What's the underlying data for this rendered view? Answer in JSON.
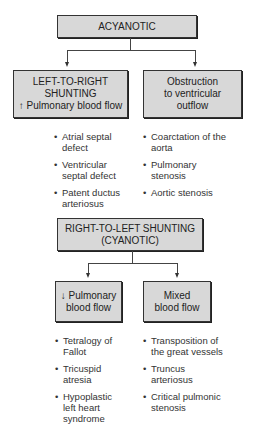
{
  "acyanotic": {
    "title": "ACYANOTIC",
    "left": {
      "line1": "LEFT-TO-RIGHT",
      "line2": "SHUNTING",
      "line3": "↑ Pulmonary blood flow",
      "items": [
        "Atrial septal defect",
        "Ventricular septal defect",
        "Patent ductus arteriosus"
      ]
    },
    "right": {
      "line1": "Obstruction",
      "line2": "to ventricular",
      "line3": "outflow",
      "items": [
        "Coarctation of the aorta",
        "Pulmonary stenosis",
        "Aortic stenosis"
      ]
    }
  },
  "cyanotic": {
    "title_line1": "RIGHT-TO-LEFT SHUNTING",
    "title_line2": "(CYANOTIC)",
    "left": {
      "line1": "↓ Pulmonary",
      "line2": "blood flow",
      "items": [
        "Tetralogy of Fallot",
        "Tricuspid atresia",
        "Hypoplastic left heart syndrome"
      ]
    },
    "right": {
      "line1": "Mixed",
      "line2": "blood flow",
      "items": [
        "Transposition of the great vessels",
        "Truncus arteriosus",
        "Critical pulmonic stenosis"
      ]
    }
  }
}
